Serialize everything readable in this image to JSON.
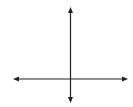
{
  "chart_data": {
    "type": "line",
    "title": "",
    "function": "y = x^2 + 2",
    "shading": "above",
    "boundary": "solid",
    "vertex": [
      0,
      2
    ],
    "xlabel": "x",
    "ylabel": "y",
    "xlim": [
      -5,
      5
    ],
    "ylim": [
      -2,
      6.3
    ],
    "x_ticks_labeled": [
      "−4",
      "−2",
      "2",
      "4"
    ],
    "y_ticks_labeled": [
      "4"
    ],
    "grid": true,
    "points": [
      [
        -2,
        6
      ],
      [
        -1,
        3
      ],
      [
        0,
        2
      ],
      [
        1,
        3
      ],
      [
        2,
        6
      ]
    ],
    "colors": {
      "curve": "#1f1f1f",
      "shade": "#c8c8c8",
      "grid": "#d2d2d2",
      "axes": "#222222"
    }
  },
  "labels": {
    "x_axis": "x",
    "y_axis": "y",
    "x_neg4": "−4",
    "x_neg2": "−2",
    "x_2": "2",
    "x_4": "4",
    "y_4": "4"
  }
}
